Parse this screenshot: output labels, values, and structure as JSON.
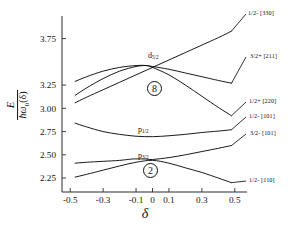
{
  "chart_data": {
    "type": "line",
    "title": "",
    "subtitle": "",
    "xlabel": "δ",
    "ylabel_numerator": "E",
    "ylabel_denominator_h": "ħ",
    "ylabel_denominator_w": "ω",
    "ylabel_denominator_sub": "0",
    "ylabel_denominator_arg": "(δ)",
    "ylabel_plain": "E / ħω₀(δ)",
    "xlim": [
      -0.55,
      0.55
    ],
    "ylim": [
      2.1,
      3.95
    ],
    "grid": false,
    "legend": "right-inline-labels",
    "xticks": [
      -0.5,
      -0.3,
      -0.1,
      0,
      0.1,
      0.3,
      0.5
    ],
    "xticklabels": [
      "-0.5",
      "-0.3",
      "-0.1",
      "0",
      "0.1",
      "0.3",
      "0.5"
    ],
    "yticks": [
      3.75,
      3.25,
      3.0,
      2.75,
      2.5,
      2.25
    ],
    "yticklabels": [
      "3.75",
      "3.25",
      "3.00",
      "2.75",
      "2.50",
      "2.25"
    ],
    "series": [
      {
        "name": "1/2- [330]",
        "label": "1/2- [330]",
        "points": [
          {
            "x": -0.47,
            "y": 3.06
          },
          {
            "x": -0.4,
            "y": 3.12
          },
          {
            "x": -0.3,
            "y": 3.2
          },
          {
            "x": -0.2,
            "y": 3.28
          },
          {
            "x": -0.1,
            "y": 3.36
          },
          {
            "x": 0.0,
            "y": 3.44
          },
          {
            "x": 0.1,
            "y": 3.52
          },
          {
            "x": 0.2,
            "y": 3.6
          },
          {
            "x": 0.3,
            "y": 3.68
          },
          {
            "x": 0.4,
            "y": 3.76
          },
          {
            "x": 0.48,
            "y": 3.83
          }
        ]
      },
      {
        "name": "3/2+ [211]",
        "label": "3/2+ [211]",
        "points": [
          {
            "x": -0.47,
            "y": 3.14
          },
          {
            "x": -0.4,
            "y": 3.22
          },
          {
            "x": -0.3,
            "y": 3.32
          },
          {
            "x": -0.2,
            "y": 3.4
          },
          {
            "x": -0.1,
            "y": 3.45
          },
          {
            "x": -0.04,
            "y": 3.46
          },
          {
            "x": 0.0,
            "y": 3.45
          },
          {
            "x": 0.1,
            "y": 3.42
          },
          {
            "x": 0.2,
            "y": 3.38
          },
          {
            "x": 0.3,
            "y": 3.34
          },
          {
            "x": 0.4,
            "y": 3.3
          },
          {
            "x": 0.48,
            "y": 3.27
          }
        ]
      },
      {
        "name": "1/2+ [220]",
        "label": "1/2+ [220]",
        "points": [
          {
            "x": -0.47,
            "y": 3.29
          },
          {
            "x": -0.4,
            "y": 3.34
          },
          {
            "x": -0.3,
            "y": 3.4
          },
          {
            "x": -0.2,
            "y": 3.44
          },
          {
            "x": -0.1,
            "y": 3.46
          },
          {
            "x": -0.04,
            "y": 3.46
          },
          {
            "x": 0.0,
            "y": 3.44
          },
          {
            "x": 0.1,
            "y": 3.36
          },
          {
            "x": 0.2,
            "y": 3.25
          },
          {
            "x": 0.3,
            "y": 3.13
          },
          {
            "x": 0.4,
            "y": 3.01
          },
          {
            "x": 0.48,
            "y": 2.92
          }
        ]
      },
      {
        "name": "1/2- [101]",
        "label": "1/2- [101]",
        "points": [
          {
            "x": -0.47,
            "y": 2.84
          },
          {
            "x": -0.4,
            "y": 2.8
          },
          {
            "x": -0.3,
            "y": 2.75
          },
          {
            "x": -0.2,
            "y": 2.72
          },
          {
            "x": -0.1,
            "y": 2.7
          },
          {
            "x": 0.0,
            "y": 2.695
          },
          {
            "x": 0.1,
            "y": 2.705
          },
          {
            "x": 0.2,
            "y": 2.72
          },
          {
            "x": 0.3,
            "y": 2.74
          },
          {
            "x": 0.4,
            "y": 2.755
          },
          {
            "x": 0.48,
            "y": 2.77
          }
        ]
      },
      {
        "name": "3/2- [101]",
        "label": "3/2- [101]",
        "points": [
          {
            "x": -0.47,
            "y": 2.41
          },
          {
            "x": -0.4,
            "y": 2.42
          },
          {
            "x": -0.3,
            "y": 2.43
          },
          {
            "x": -0.2,
            "y": 2.44
          },
          {
            "x": -0.12,
            "y": 2.455
          },
          {
            "x": -0.05,
            "y": 2.455
          },
          {
            "x": 0.0,
            "y": 2.45
          },
          {
            "x": 0.1,
            "y": 2.47
          },
          {
            "x": 0.2,
            "y": 2.5
          },
          {
            "x": 0.3,
            "y": 2.535
          },
          {
            "x": 0.4,
            "y": 2.57
          },
          {
            "x": 0.48,
            "y": 2.6
          }
        ]
      },
      {
        "name": "1/2- [110]",
        "label": "1/2- [110]",
        "points": [
          {
            "x": -0.47,
            "y": 2.26
          },
          {
            "x": -0.4,
            "y": 2.29
          },
          {
            "x": -0.3,
            "y": 2.335
          },
          {
            "x": -0.2,
            "y": 2.38
          },
          {
            "x": -0.1,
            "y": 2.42
          },
          {
            "x": 0.0,
            "y": 2.44
          },
          {
            "x": 0.1,
            "y": 2.41
          },
          {
            "x": 0.2,
            "y": 2.36
          },
          {
            "x": 0.3,
            "y": 2.31
          },
          {
            "x": 0.4,
            "y": 2.25
          },
          {
            "x": 0.48,
            "y": 2.2
          }
        ]
      }
    ],
    "annotations": [
      {
        "name": "shell-d52",
        "text": "d",
        "sub": "5/2",
        "x": 0.0,
        "y": 3.38
      },
      {
        "name": "shell-p12",
        "text": "p",
        "sub": "1/2",
        "x": -0.02,
        "y": 2.62
      },
      {
        "name": "shell-p32",
        "text": "p",
        "sub": "3/2",
        "x": 0.0,
        "y": 2.38
      },
      {
        "name": "magic-8",
        "text": "8",
        "x": -0.1,
        "y": 2.93
      },
      {
        "name": "magic-2",
        "text": "2",
        "x": -0.1,
        "y": 2.26
      }
    ]
  },
  "axes": {
    "x_label": "δ",
    "y_label": "E / ħω₀(δ)"
  },
  "labels": {
    "right": [
      {
        "id": "lvl-330",
        "text": "1/2- [330]"
      },
      {
        "id": "lvl-211",
        "text": "3/2+ [211]"
      },
      {
        "id": "lvl-220",
        "text": "1/2+ [220]"
      },
      {
        "id": "lvl-101a",
        "text": "1/2- [101]"
      },
      {
        "id": "lvl-101b",
        "text": "3/2- [101]"
      },
      {
        "id": "lvl-110",
        "text": "1/2- [110]"
      }
    ]
  },
  "ylabel_parts": {
    "numerator": "E",
    "hbar": "ħ",
    "omega": "ω",
    "sub": "0",
    "arg": "(δ)"
  },
  "magic_numbers": {
    "upper": "8",
    "lower": "2"
  },
  "shells": {
    "d": "d",
    "d_sub": "5/2",
    "p_upper": "p",
    "p_upper_sub": "1/2",
    "p_lower": "p",
    "p_lower_sub": "3/2"
  },
  "colors": {
    "curve": "#000000",
    "axis": "#2b2b2b",
    "text": "#111111",
    "background": "#ffffff"
  }
}
